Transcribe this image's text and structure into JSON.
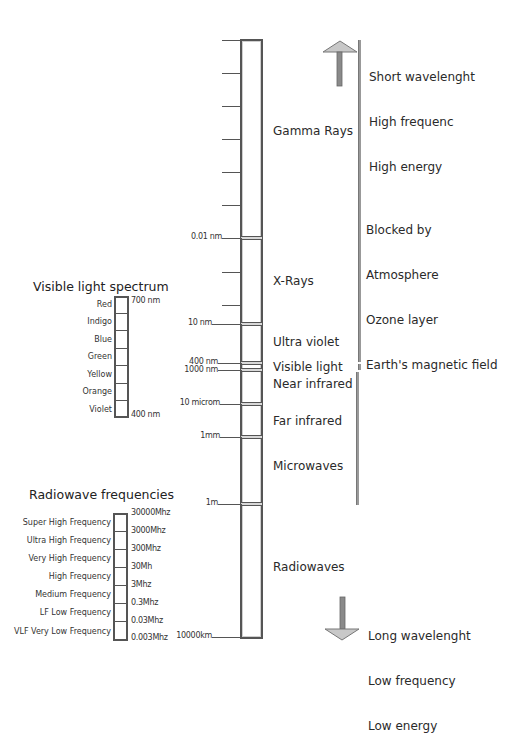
{
  "main_bar": {
    "top_label_ticks": [
      "",
      "",
      "",
      "",
      "",
      ""
    ],
    "scale_labels": [
      {
        "text": "0.01 nm",
        "y": 238
      },
      {
        "text": "10 nm",
        "y": 324
      },
      {
        "text": "400 nm",
        "y": 363
      },
      {
        "text": "1000 nm",
        "y": 370
      },
      {
        "text": "10 microm",
        "y": 404
      },
      {
        "text": "1mm",
        "y": 437
      },
      {
        "text": "1m",
        "y": 504
      },
      {
        "text": "10000km",
        "y": 637
      }
    ],
    "bands": [
      {
        "name": "Gamma Rays",
        "y": 132
      },
      {
        "name": "X-Rays",
        "y": 282
      },
      {
        "name": "Ultra violet",
        "y": 343
      },
      {
        "name": "Visible light",
        "y": 368
      },
      {
        "name": "Near infrared",
        "y": 384
      },
      {
        "name": "Far infrared",
        "y": 421
      },
      {
        "name": "Microwaves",
        "y": 467
      },
      {
        "name": "Radiowaves",
        "y": 568
      }
    ]
  },
  "top_note": {
    "lines": [
      "Short wavelenght",
      "High frequenc",
      "High energy"
    ]
  },
  "blocked_note": {
    "lines": [
      "Blocked by",
      "Atmosphere",
      "Ozone layer",
      "Earth's magnetic field"
    ]
  },
  "bottom_note": {
    "lines": [
      "Long wavelenght",
      "Low frequency",
      "Low energy"
    ]
  },
  "visible_spectrum": {
    "title": "Visible light spectrum",
    "colors": [
      "Red",
      "Indigo",
      "Blue",
      "Green",
      "Yellow",
      "Orange",
      "Violet"
    ],
    "top_value": "700 nm",
    "bottom_value": "400 nm"
  },
  "radiowave_frequencies": {
    "title": "Radiowave frequencies",
    "bands": [
      "Super High Frequency",
      "Ultra High Frequency",
      "Very High Frequency",
      "High Frequency",
      "Medium Frequency",
      "LF Low Frequency",
      "VLF Very Low Frequency"
    ],
    "values": [
      "30000Mhz",
      "3000Mhz",
      "300Mhz",
      "30Mh",
      "3Mhz",
      "0.3Mhz",
      "0.03Mhz",
      "0.003Mhz"
    ]
  }
}
